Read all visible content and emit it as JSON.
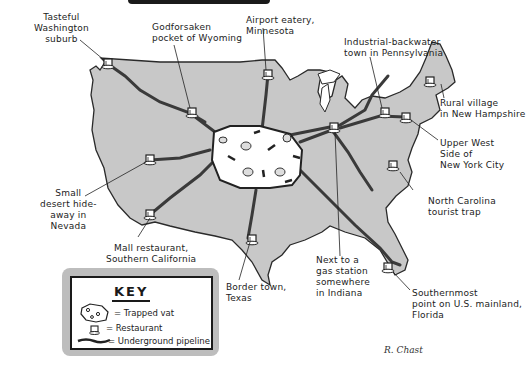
{
  "map": {
    "title": "Trapped vat pipeline map of the United States",
    "colors": {
      "land": "#c8c8c8",
      "outline": "#2a2a2a",
      "vat": "#ffffff",
      "pipeline": "#3a3a3a",
      "key_shadow": "#bdbdbd"
    },
    "central_feature": "Trapped vat",
    "locations": [
      {
        "id": "washington",
        "label": "Tasteful\nWashington\nsuburb"
      },
      {
        "id": "wyoming",
        "label": "Godforsaken\npocket of Wyoming"
      },
      {
        "id": "minnesota",
        "label": "Airport eatery,\nMinnesota"
      },
      {
        "id": "pennsylvania",
        "label": "Industrial-backwater\ntown in Pennsylvania"
      },
      {
        "id": "new-hampshire",
        "label": "Rural village\nin New Hampshire"
      },
      {
        "id": "nyc",
        "label": "Upper West\nSide of\nNew York City"
      },
      {
        "id": "north-carolina",
        "label": "North Carolina\ntourist trap"
      },
      {
        "id": "florida",
        "label": "Southernmost\npoint on U.S. mainland,\nFlorida"
      },
      {
        "id": "indiana",
        "label": "Next to a\ngas station\nsomewhere\nin Indiana"
      },
      {
        "id": "texas",
        "label": "Border town,\nTexas"
      },
      {
        "id": "california",
        "label": "Mall restaurant,\nSouthern California"
      },
      {
        "id": "nevada",
        "label": "Small\ndesert hide-\naway in\nNevada"
      }
    ]
  },
  "key": {
    "title": "KEY",
    "items": [
      {
        "icon": "trapped-vat-icon",
        "label": "= Trapped vat"
      },
      {
        "icon": "restaurant-icon",
        "label": "= Restaurant"
      },
      {
        "icon": "pipeline-icon",
        "label": "= Underground pipeline"
      }
    ]
  },
  "signature": "R. Chast"
}
